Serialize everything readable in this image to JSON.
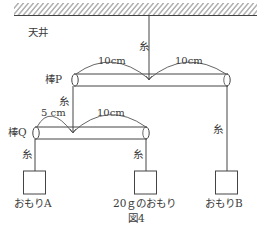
{
  "figure": {
    "caption": "図4",
    "ceiling_label": "天井",
    "string_label": "糸",
    "rod_p": {
      "label": "棒P",
      "left_length": "10cm",
      "right_length": "10cm"
    },
    "rod_q": {
      "label": "棒Q",
      "left_length": "5 cm",
      "right_length": "10cm"
    },
    "weights": [
      {
        "label": "おもりA"
      },
      {
        "label": "20ｇのおもり"
      },
      {
        "label": "おもりB"
      }
    ]
  }
}
